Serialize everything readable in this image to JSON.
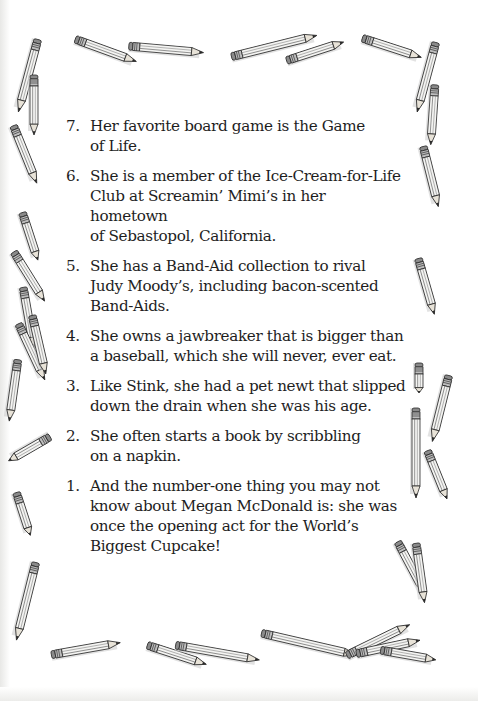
{
  "page": {
    "background": "#ffffff",
    "text_color": "#1e1e1e",
    "decoration": "hand-drawn-pencil-border"
  },
  "facts": [
    {
      "number": "7.",
      "text": "Her favorite board game is the Game\nof Life."
    },
    {
      "number": "6.",
      "text": "She is a member of the Ice-Cream-for-Life\nClub at Screamin’ Mimi’s in her hometown\nof Sebastopol, California."
    },
    {
      "number": "5.",
      "text": "She has a Band-Aid collection to rival\nJudy Moody’s, including bacon-scented\nBand-Aids."
    },
    {
      "number": "4.",
      "text": "She owns a jawbreaker that is bigger than\na baseball, which she will never, ever eat."
    },
    {
      "number": "3.",
      "text": "Like Stink, she had a pet newt that slipped\ndown the drain when she was his age."
    },
    {
      "number": "2.",
      "text": "She often starts a book by scribbling\non a napkin."
    },
    {
      "number": "1.",
      "text": "And the number-one thing you may not\nknow about Megan McDonald is: she was\nonce the opening act for the World’s\nBiggest Cupcake!"
    }
  ],
  "pencils": [
    {
      "x": 75,
      "y": 35,
      "len": 65,
      "angle": 20
    },
    {
      "x": 128,
      "y": 42,
      "len": 75,
      "angle": 5
    },
    {
      "x": 230,
      "y": 53,
      "len": 88,
      "angle": -14
    },
    {
      "x": 285,
      "y": 57,
      "len": 60,
      "angle": -18
    },
    {
      "x": 362,
      "y": 34,
      "len": 62,
      "angle": 18
    },
    {
      "x": 438,
      "y": 40,
      "len": 72,
      "angle": 105
    },
    {
      "x": 437,
      "y": 82,
      "len": 60,
      "angle": 94
    },
    {
      "x": 40,
      "y": 37,
      "len": 75,
      "angle": 105
    },
    {
      "x": 36,
      "y": 72,
      "len": 60,
      "angle": 90
    },
    {
      "x": 15,
      "y": 122,
      "len": 62,
      "angle": 68
    },
    {
      "x": 24,
      "y": 209,
      "len": 50,
      "angle": 72
    },
    {
      "x": 15,
      "y": 248,
      "len": 58,
      "angle": 58
    },
    {
      "x": 25,
      "y": 284,
      "len": 62,
      "angle": 80
    },
    {
      "x": 20,
      "y": 320,
      "len": 62,
      "angle": 65
    },
    {
      "x": 34,
      "y": 312,
      "len": 60,
      "angle": 77
    },
    {
      "x": 20,
      "y": 357,
      "len": 62,
      "angle": 98
    },
    {
      "x": 52,
      "y": 436,
      "len": 48,
      "angle": 150
    },
    {
      "x": 18,
      "y": 489,
      "len": 45,
      "angle": 72
    },
    {
      "x": 38,
      "y": 560,
      "len": 80,
      "angle": 104
    },
    {
      "x": 425,
      "y": 143,
      "len": 62,
      "angle": 76
    },
    {
      "x": 420,
      "y": 255,
      "len": 58,
      "angle": 74
    },
    {
      "x": 421,
      "y": 360,
      "len": 30,
      "angle": 90
    },
    {
      "x": 451,
      "y": 373,
      "len": 68,
      "angle": 104
    },
    {
      "x": 418,
      "y": 405,
      "len": 90,
      "angle": 90
    },
    {
      "x": 429,
      "y": 447,
      "len": 52,
      "angle": 68
    },
    {
      "x": 399,
      "y": 538,
      "len": 58,
      "angle": 62
    },
    {
      "x": 418,
      "y": 540,
      "len": 60,
      "angle": 82
    },
    {
      "x": 50,
      "y": 651,
      "len": 70,
      "angle": -10
    },
    {
      "x": 147,
      "y": 641,
      "len": 62,
      "angle": 18
    },
    {
      "x": 175,
      "y": 641,
      "len": 85,
      "angle": 10
    },
    {
      "x": 261,
      "y": 629,
      "len": 97,
      "angle": 13
    },
    {
      "x": 345,
      "y": 652,
      "len": 70,
      "angle": -26
    },
    {
      "x": 355,
      "y": 650,
      "len": 65,
      "angle": -12
    },
    {
      "x": 380,
      "y": 646,
      "len": 56,
      "angle": 10
    }
  ]
}
